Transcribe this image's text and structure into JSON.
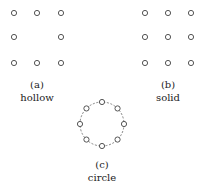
{
  "panels": [
    {
      "id": "a",
      "tag": "(a)",
      "name": "hollow",
      "cx": 37,
      "dots": [
        [
          14,
          13
        ],
        [
          37,
          13
        ],
        [
          61,
          13
        ],
        [
          14,
          37
        ],
        [
          61,
          37
        ],
        [
          14,
          63
        ],
        [
          37,
          63
        ],
        [
          61,
          63
        ]
      ],
      "tag_y": 79,
      "name_y": 92
    },
    {
      "id": "b",
      "tag": "(b)",
      "name": "solid",
      "cx": 168,
      "dots": [
        [
          145,
          13
        ],
        [
          168,
          13
        ],
        [
          191,
          13
        ],
        [
          145,
          37
        ],
        [
          168,
          37
        ],
        [
          191,
          37
        ],
        [
          145,
          63
        ],
        [
          168,
          63
        ],
        [
          191,
          63
        ]
      ],
      "tag_y": 79,
      "name_y": 92
    },
    {
      "id": "c",
      "tag": "(c)",
      "name": "circle",
      "cx": 102,
      "circle": {
        "cx": 102,
        "cy": 124,
        "r": 22,
        "n": 8
      },
      "tag_y": 159,
      "name_y": 172
    }
  ],
  "colors": {
    "stroke": "#555555",
    "dash": "#666666",
    "text": "#222222"
  },
  "dot_radius": 2.6
}
